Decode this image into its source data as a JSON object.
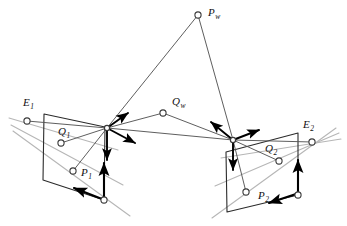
{
  "figure": {
    "background_color": "#ffffff",
    "width": 347,
    "height": 226
  },
  "style": {
    "line_dark": "#2b2b2b",
    "line_mid": "#555555",
    "line_light": "#b6b6b6",
    "arrow_black": "#000000",
    "node_fill": "#ffffff",
    "node_stroke": "#3a3a3a",
    "label_color": "#111111"
  },
  "labels": {
    "pw": {
      "base": "P",
      "sub": "w",
      "x": 208,
      "y": 16
    },
    "qw": {
      "base": "Q",
      "sub": "w",
      "x": 172,
      "y": 105
    },
    "e1": {
      "base": "E",
      "sub": "1",
      "x": 23,
      "y": 106
    },
    "e2": {
      "base": "E",
      "sub": "2",
      "x": 303,
      "y": 128
    },
    "q1": {
      "base": "Q",
      "sub": "1",
      "x": 58,
      "y": 135
    },
    "p1": {
      "base": "P",
      "sub": "1",
      "x": 81,
      "y": 176
    },
    "q2": {
      "base": "Q",
      "sub": "2",
      "x": 265,
      "y": 152
    },
    "p2": {
      "base": "P",
      "sub": "2",
      "x": 258,
      "y": 199
    }
  },
  "nodes": [
    {
      "name": "world-point-pw",
      "x": 198,
      "y": 15,
      "r": 3.1
    },
    {
      "name": "world-point-qw",
      "x": 163,
      "y": 113,
      "r": 3.1
    },
    {
      "name": "epipole-e1",
      "x": 27,
      "y": 121,
      "r": 3.1
    },
    {
      "name": "epipole-e2",
      "x": 312,
      "y": 142,
      "r": 3.1
    },
    {
      "name": "image-point-q1",
      "x": 61,
      "y": 143,
      "r": 3.1
    },
    {
      "name": "image-point-p1",
      "x": 73,
      "y": 171,
      "r": 3.1
    },
    {
      "name": "image-point-q2",
      "x": 279,
      "y": 161,
      "r": 3.1
    },
    {
      "name": "image-point-p2",
      "x": 246,
      "y": 192,
      "r": 3.1
    },
    {
      "name": "plane-corner-left-br",
      "x": 104,
      "y": 200,
      "r": 3.1
    },
    {
      "name": "plane-corner-right-br",
      "x": 298,
      "y": 195,
      "r": 3.1
    }
  ],
  "camera_centers": [
    {
      "name": "camera-center-left",
      "x": 107,
      "y": 128
    },
    {
      "name": "camera-center-right",
      "x": 233,
      "y": 140
    }
  ],
  "image_planes": [
    {
      "name": "image-plane-left",
      "points": "44,114 105,127 104,200 43,180"
    },
    {
      "name": "image-plane-right",
      "points": "226,152 298,133 298,195 227,212"
    }
  ],
  "rays": [
    {
      "name": "ray-pw-to-left-center",
      "x1": 198,
      "y1": 15,
      "x2": 107,
      "y2": 128
    },
    {
      "name": "ray-pw-to-right-center",
      "x1": 198,
      "y1": 15,
      "x2": 233,
      "y2": 140
    },
    {
      "name": "ray-qw-to-left-center",
      "x1": 163,
      "y1": 113,
      "x2": 107,
      "y2": 128
    },
    {
      "name": "ray-qw-to-right-center",
      "x1": 163,
      "y1": 113,
      "x2": 233,
      "y2": 140
    },
    {
      "name": "baseline-left-to-right-center",
      "x1": 107,
      "y1": 128,
      "x2": 233,
      "y2": 140
    },
    {
      "name": "ray-left-center-to-p1",
      "x1": 107,
      "y1": 128,
      "x2": 73,
      "y2": 171
    },
    {
      "name": "ray-left-center-to-q1",
      "x1": 107,
      "y1": 128,
      "x2": 61,
      "y2": 143
    },
    {
      "name": "ray-right-center-to-p2",
      "x1": 233,
      "y1": 140,
      "x2": 246,
      "y2": 192
    },
    {
      "name": "ray-right-center-to-q2",
      "x1": 233,
      "y1": 140,
      "x2": 279,
      "y2": 161
    },
    {
      "name": "ray-e1-to-left-center",
      "x1": 27,
      "y1": 121,
      "x2": 107,
      "y2": 128
    },
    {
      "name": "ray-e2-to-right-center",
      "x1": 312,
      "y1": 142,
      "x2": 233,
      "y2": 140
    }
  ],
  "epipolar_lines_left": [
    {
      "name": "epipolar-line-left-through-q1",
      "x1": 9,
      "y1": 118,
      "x2": 118,
      "y2": 150
    },
    {
      "name": "epipolar-line-left-through-p1",
      "x1": 11,
      "y1": 125,
      "x2": 123,
      "y2": 185
    },
    {
      "name": "epipolar-line-left-lower",
      "x1": 13,
      "y1": 131,
      "x2": 130,
      "y2": 216
    }
  ],
  "epipolar_lines_right": [
    {
      "name": "epipolar-line-right-through-q2",
      "x1": 341,
      "y1": 139,
      "x2": 221,
      "y2": 158
    },
    {
      "name": "epipolar-line-right-through-p2",
      "x1": 339,
      "y1": 133,
      "x2": 215,
      "y2": 186
    },
    {
      "name": "epipolar-line-right-lower",
      "x1": 336,
      "y1": 128,
      "x2": 212,
      "y2": 218
    }
  ],
  "frame_axes": [
    {
      "name": "axis-arrow-left-up-right",
      "x1": 107,
      "y1": 128,
      "x2": 128,
      "y2": 113
    },
    {
      "name": "axis-arrow-left-down-right",
      "x1": 107,
      "y1": 128,
      "x2": 135,
      "y2": 143
    },
    {
      "name": "axis-arrow-left-down",
      "x1": 107,
      "y1": 128,
      "x2": 107,
      "y2": 160
    },
    {
      "name": "axis-arrow-right-up-left",
      "x1": 233,
      "y1": 140,
      "x2": 211,
      "y2": 122
    },
    {
      "name": "axis-arrow-right-up-right",
      "x1": 233,
      "y1": 140,
      "x2": 259,
      "y2": 130
    },
    {
      "name": "axis-arrow-right-down",
      "x1": 233,
      "y1": 140,
      "x2": 233,
      "y2": 170
    }
  ],
  "plane_axes": [
    {
      "name": "plane-axis-left-up",
      "x1": 104,
      "y1": 198,
      "x2": 104,
      "y2": 163
    },
    {
      "name": "plane-axis-left-left",
      "x1": 102,
      "y1": 199,
      "x2": 74,
      "y2": 188
    },
    {
      "name": "plane-axis-right-up",
      "x1": 298,
      "y1": 193,
      "x2": 298,
      "y2": 160
    },
    {
      "name": "plane-axis-right-left",
      "x1": 296,
      "y1": 194,
      "x2": 269,
      "y2": 203
    }
  ]
}
